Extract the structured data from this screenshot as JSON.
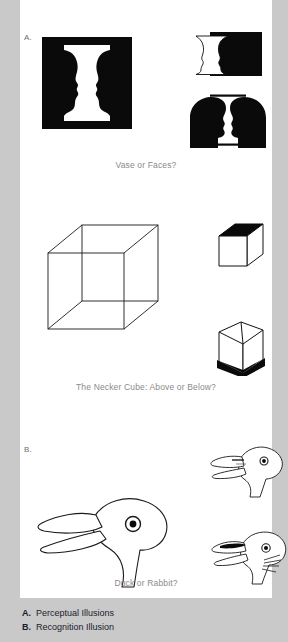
{
  "figure": {
    "background_color": "#c9c9c9",
    "plate_color": "#ffffff",
    "ink_color": "#000000",
    "caption_color": "#8a8a8a"
  },
  "panels": [
    {
      "letter": "A.",
      "caption_vase": "Vase or Faces?",
      "caption_cube": "The Necker Cube: Above or Below?",
      "figures": [
        {
          "name": "rubin-vase-main",
          "description": "Vase or Faces"
        },
        {
          "name": "rubin-vase-profile-small",
          "description": "Vase profile"
        },
        {
          "name": "two-faces-silhouette",
          "description": "Two facing heads"
        },
        {
          "name": "necker-cube-large",
          "description": "Necker cube wireframe"
        },
        {
          "name": "cube-top-black",
          "description": "Cube seen from above"
        },
        {
          "name": "cube-bottom-black",
          "description": "Cube seen from below"
        }
      ]
    },
    {
      "letter": "B.",
      "caption_duck": "Duck or Rabbit?",
      "figures": [
        {
          "name": "duck-rabbit-main",
          "description": "Ambiguous duck rabbit head"
        },
        {
          "name": "duck-head-small",
          "description": "Duck reading"
        },
        {
          "name": "rabbit-head-small",
          "description": "Rabbit reading"
        }
      ]
    }
  ],
  "legend": [
    {
      "key": "A.",
      "text": "Perceptual Illusions"
    },
    {
      "key": "B.",
      "text": "Recognition Illusion"
    }
  ]
}
